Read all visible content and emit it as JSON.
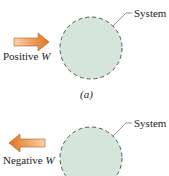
{
  "panels": [
    {
      "id": "a",
      "system_label": "System",
      "work_label": "Positive",
      "work_symbol": "W",
      "caption": "(a)",
      "arrow_direction": "into-system"
    },
    {
      "id": "b",
      "system_label": "System",
      "work_label": "Negative",
      "work_symbol": "W",
      "caption": "",
      "arrow_direction": "out-of-system"
    }
  ],
  "colors": {
    "system_fill": "#d4e6dc",
    "system_border": "#555555",
    "arrow_light": "#f6c79b",
    "arrow_dark": "#e07a2a"
  }
}
